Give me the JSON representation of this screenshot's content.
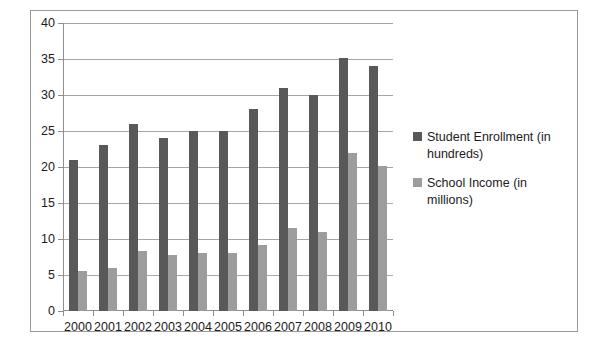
{
  "chart_data": {
    "type": "bar",
    "title": "",
    "xlabel": "",
    "ylabel": "",
    "ylim": [
      0,
      40
    ],
    "ytick_step": 5,
    "grid": true,
    "legend_position": "right",
    "categories": [
      "2000",
      "2001",
      "2002",
      "2003",
      "2004",
      "2005",
      "2006",
      "2007",
      "2008",
      "2009",
      "2010"
    ],
    "ytick_labels": [
      "40",
      "35",
      "30",
      "25",
      "20",
      "15",
      "10",
      "5",
      "0"
    ],
    "ytick_values": [
      40,
      35,
      30,
      25,
      20,
      15,
      10,
      5,
      0
    ],
    "series": [
      {
        "name": "Student Enrollment (in hundreds)",
        "color": "#595959",
        "values": [
          21,
          23,
          26,
          24,
          25,
          25,
          28,
          31,
          30,
          35.2,
          34
        ]
      },
      {
        "name": "School Income (in millions)",
        "color": "#9d9d9d",
        "values": [
          5.5,
          6,
          8.4,
          7.8,
          8,
          8,
          9.2,
          11.5,
          11,
          22,
          20.2
        ]
      }
    ]
  },
  "legend": {
    "items": [
      {
        "label": "Student Enrollment (in hundreds)",
        "color": "#595959"
      },
      {
        "label": "School Income (in millions)",
        "color": "#9d9d9d"
      }
    ]
  },
  "colors": {
    "series_a": "#595959",
    "series_b": "#9d9d9d",
    "gridline": "#a6a6a6",
    "frame": "#9a9a9a",
    "text": "#1b1b1b",
    "background": "#ffffff"
  }
}
